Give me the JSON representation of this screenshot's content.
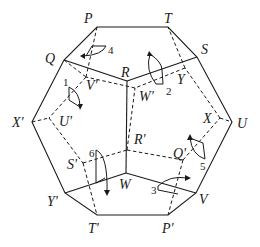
{
  "figure": {
    "vertices_visible": {
      "P": "P",
      "T": "T",
      "S": "S",
      "U": "U",
      "V": "V",
      "P_prime": "P'",
      "T_prime": "T'",
      "Y_prime": "Y'",
      "X_prime": "X'",
      "Q": "Q",
      "R": "R",
      "W": "W"
    },
    "vertices_hidden": {
      "V_prime": "V'",
      "W_prime": "W'",
      "Y": "Y",
      "X": "X",
      "Q_prime": "Q'",
      "S_prime": "S'",
      "U_prime": "U'",
      "R_prime": "R'"
    },
    "rotation_markers": [
      "1",
      "2",
      "3",
      "4",
      "5",
      "6"
    ]
  }
}
